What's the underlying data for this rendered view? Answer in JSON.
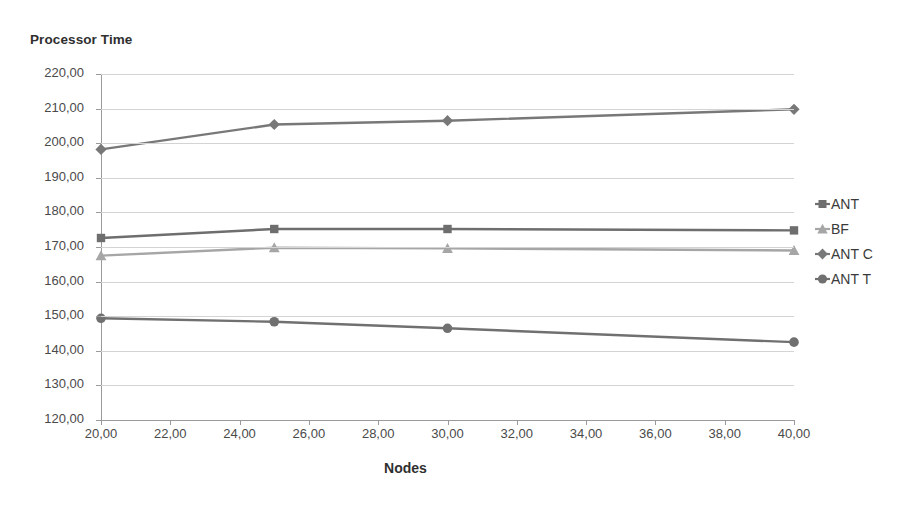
{
  "chart_data": {
    "type": "line",
    "title": "Processor Time",
    "xlabel": "Nodes",
    "ylabel": "",
    "x": [
      20,
      25,
      30,
      40
    ],
    "xlim": [
      20,
      40
    ],
    "ylim": [
      120,
      220
    ],
    "xticks": [
      "20,00",
      "22,00",
      "24,00",
      "26,00",
      "28,00",
      "30,00",
      "32,00",
      "34,00",
      "36,00",
      "38,00",
      "40,00"
    ],
    "xtick_values": [
      20,
      22,
      24,
      26,
      28,
      30,
      32,
      34,
      36,
      38,
      40
    ],
    "yticks": [
      "220,00",
      "210,00",
      "200,00",
      "190,00",
      "180,00",
      "170,00",
      "160,00",
      "150,00",
      "140,00",
      "130,00",
      "120,00"
    ],
    "ytick_values": [
      220,
      210,
      200,
      190,
      180,
      170,
      160,
      150,
      140,
      130,
      120
    ],
    "grid": true,
    "legend_position": "right",
    "series": [
      {
        "name": "ANT",
        "marker": "square",
        "color": "#6e6e6e",
        "values": [
          172.6,
          175.2,
          175.2,
          174.8
        ]
      },
      {
        "name": "BF",
        "marker": "triangle",
        "color": "#a6a6a6",
        "values": [
          167.5,
          169.8,
          169.6,
          169.0
        ]
      },
      {
        "name": "ANT C",
        "marker": "diamond",
        "color": "#787878",
        "values": [
          198.2,
          205.4,
          206.5,
          209.8
        ]
      },
      {
        "name": "ANT T",
        "marker": "circle",
        "color": "#707070",
        "values": [
          149.4,
          148.4,
          146.5,
          142.5
        ]
      }
    ]
  },
  "colors": {
    "axis": "#9a9a9a",
    "gridline": "#d4d4d4",
    "text": "#3a3a3a",
    "background": "#ffffff"
  }
}
